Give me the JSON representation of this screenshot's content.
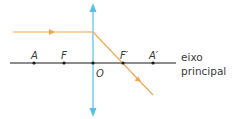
{
  "diagram": {
    "title": "",
    "colors": {
      "axis": "#1a1a1a",
      "lens": "#5bc0e8",
      "ray": "#f5a54a",
      "text": "#3a3a3a"
    },
    "axis_label_line1": "eixo",
    "axis_label_line2": "principal",
    "points": [
      {
        "id": "A",
        "label": "A",
        "x": 34
      },
      {
        "id": "F",
        "label": "F",
        "x": 64
      },
      {
        "id": "O",
        "label": "O",
        "x": 93
      },
      {
        "id": "F_prime",
        "label": "F′",
        "x": 123
      },
      {
        "id": "A_prime",
        "label": "A′",
        "x": 153
      }
    ],
    "lens": {
      "type": "converging",
      "x": 93,
      "y_top": 4,
      "y_bottom": 116
    },
    "incident_ray": {
      "x1": 13,
      "y1": 32,
      "x2": 93,
      "y2": 32
    },
    "refracted_ray": {
      "x1": 93,
      "y1": 32,
      "x2": 153,
      "y2": 95
    }
  }
}
